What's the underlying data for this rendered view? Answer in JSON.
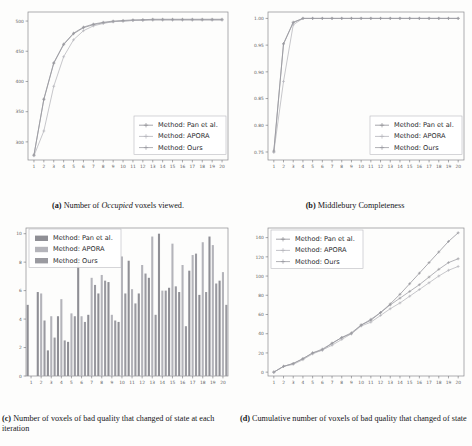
{
  "figure": {
    "panels": [
      {
        "id": "a",
        "caption_label": "(a)",
        "caption_pre": " Number of ",
        "caption_em": "Occupied",
        "caption_post": " voxels viewed."
      },
      {
        "id": "b",
        "caption_label": "(b)",
        "caption_pre": " Middlebury Completeness",
        "caption_em": "",
        "caption_post": ""
      },
      {
        "id": "c",
        "caption_label": "(c)",
        "caption_pre": " Number of voxels of bad quality that changed of state at each iteration",
        "caption_em": "",
        "caption_post": ""
      },
      {
        "id": "d",
        "caption_label": "(d)",
        "caption_pre": " Cumulative number of voxels of bad quality that changed of state",
        "caption_em": "",
        "caption_post": ""
      }
    ]
  },
  "legend_labels": {
    "pan": "Method: Pan et al.",
    "apora": "Method: APORA",
    "ours": "Method: Ours"
  },
  "colors": {
    "series_pan": "#8f8f95",
    "series_apora": "#b4b4ba",
    "series_ours": "#9a9aa0",
    "axis": "#6e6e73",
    "frame": "#8a8a8f",
    "text": "#1c1c1c",
    "tick_text": "#5f5f63",
    "legend_frame": "#b9b9be",
    "page_bg": "#fdfdfc"
  },
  "chart_data": [
    {
      "type": "line",
      "panel": "a",
      "title": "Number of Occupied voxels viewed.",
      "xlabel": "",
      "ylabel": "",
      "grid": false,
      "legend_position": "lower-right",
      "x": [
        1,
        2,
        3,
        4,
        5,
        6,
        7,
        8,
        9,
        10,
        11,
        12,
        13,
        14,
        15,
        16,
        17,
        18,
        19,
        20
      ],
      "xticklabels": [
        "1",
        "2",
        "3",
        "4",
        "5",
        "6",
        "7",
        "8",
        "9",
        "10",
        "11",
        "12",
        "13",
        "14",
        "15",
        "16",
        "17",
        "18",
        "19",
        "20"
      ],
      "yticklabels": [
        "300",
        "350",
        "400",
        "450",
        "500"
      ],
      "ytickvalues": [
        300,
        350,
        400,
        450,
        500
      ],
      "xlim": [
        0.4,
        20.6
      ],
      "ylim": [
        270,
        515
      ],
      "series": [
        {
          "name": "Method: Pan et al.",
          "values": [
            278,
            370,
            430,
            461,
            479,
            489,
            494,
            497,
            499,
            500,
            501,
            502,
            502,
            502,
            502,
            502,
            502,
            502,
            502,
            502
          ]
        },
        {
          "name": "Method: APORA",
          "values": [
            277,
            318,
            392,
            441,
            469,
            484,
            492,
            496,
            499,
            500,
            501,
            501,
            502,
            502,
            502,
            502,
            502,
            502,
            502,
            502
          ]
        },
        {
          "name": "Method: Ours",
          "values": [
            278,
            371,
            431,
            462,
            480,
            490,
            495,
            498,
            500,
            501,
            502,
            502,
            503,
            503,
            503,
            503,
            503,
            503,
            503,
            503
          ]
        }
      ]
    },
    {
      "type": "line",
      "panel": "b",
      "title": "Middlebury Completeness",
      "xlabel": "",
      "ylabel": "",
      "grid": false,
      "legend_position": "lower-right",
      "x": [
        1,
        2,
        3,
        4,
        5,
        6,
        7,
        8,
        9,
        10,
        11,
        12,
        13,
        14,
        15,
        16,
        17,
        18,
        19,
        20
      ],
      "xticklabels": [
        "1",
        "2",
        "3",
        "4",
        "5",
        "6",
        "7",
        "8",
        "9",
        "10",
        "11",
        "12",
        "13",
        "14",
        "15",
        "16",
        "17",
        "18",
        "19",
        "20"
      ],
      "yticklabels": [
        "0.75",
        "0.80",
        "0.85",
        "0.90",
        "0.95",
        "1.00"
      ],
      "ytickvalues": [
        0.75,
        0.8,
        0.85,
        0.9,
        0.95,
        1.0
      ],
      "xlim": [
        0.4,
        20.6
      ],
      "ylim": [
        0.735,
        1.012
      ],
      "series": [
        {
          "name": "Method: Pan et al.",
          "values": [
            0.75,
            0.952,
            0.992,
            1.0,
            1.0,
            1.0,
            1.0,
            1.0,
            1.0,
            1.0,
            1.0,
            1.0,
            1.0,
            1.0,
            1.0,
            1.0,
            1.0,
            1.0,
            1.0,
            1.0
          ]
        },
        {
          "name": "Method: APORA",
          "values": [
            0.75,
            0.882,
            0.988,
            1.0,
            1.0,
            1.0,
            1.0,
            1.0,
            1.0,
            1.0,
            1.0,
            1.0,
            1.0,
            1.0,
            1.0,
            1.0,
            1.0,
            1.0,
            1.0,
            1.0
          ]
        },
        {
          "name": "Method: Ours",
          "values": [
            0.752,
            0.953,
            0.993,
            1.0,
            1.0,
            1.0,
            1.0,
            1.0,
            1.0,
            1.0,
            1.0,
            1.0,
            1.0,
            1.0,
            1.0,
            1.0,
            1.0,
            1.0,
            1.0,
            1.0
          ]
        }
      ]
    },
    {
      "type": "bar",
      "panel": "c",
      "title": "Number of voxels of bad quality that changed of state at each iteration",
      "xlabel": "",
      "ylabel": "",
      "grid": false,
      "legend_position": "upper-left",
      "categories": [
        "1",
        "2",
        "3",
        "4",
        "5",
        "6",
        "7",
        "8",
        "9",
        "10",
        "11",
        "12",
        "13",
        "14",
        "15",
        "16",
        "17",
        "18",
        "19",
        "20"
      ],
      "yticklabels": [
        "0",
        "2",
        "4",
        "6",
        "8",
        "10"
      ],
      "ytickvalues": [
        0,
        2,
        4,
        6,
        8,
        10
      ],
      "ylim": [
        0,
        10.4
      ],
      "series": [
        {
          "name": "Method: Pan et al.",
          "values": [
            5.0,
            5.9,
            1.8,
            4.2,
            2.4,
            8.0,
            4.3,
            5.8,
            6.6,
            3.8,
            8.1,
            5.8,
            6.9,
            10.0,
            6.2,
            5.9,
            7.4,
            5.7,
            9.8,
            6.7
          ]
        },
        {
          "name": "Method: APORA",
          "values": [
            0.0,
            5.8,
            4.2,
            5.4,
            4.4,
            4.2,
            6.9,
            7.1,
            4.3,
            8.4,
            6.1,
            7.8,
            9.8,
            6.0,
            9.3,
            7.8,
            8.5,
            9.4,
            9.2,
            7.3
          ]
        },
        {
          "name": "Method: Ours",
          "values": [
            0.0,
            3.9,
            2.7,
            2.5,
            4.2,
            3.8,
            6.4,
            6.7,
            3.9,
            5.8,
            5.1,
            7.2,
            4.3,
            6.0,
            6.3,
            3.5,
            8.6,
            5.9,
            6.5,
            5.0
          ]
        }
      ]
    },
    {
      "type": "line",
      "panel": "d",
      "title": "Cumulative number of voxels of bad quality that changed of state",
      "xlabel": "",
      "ylabel": "",
      "grid": false,
      "legend_position": "upper-left",
      "x": [
        1,
        2,
        3,
        4,
        5,
        6,
        7,
        8,
        9,
        10,
        11,
        12,
        13,
        14,
        15,
        16,
        17,
        18,
        19,
        20
      ],
      "xticklabels": [
        "1",
        "2",
        "3",
        "4",
        "5",
        "6",
        "7",
        "8",
        "9",
        "10",
        "11",
        "12",
        "13",
        "14",
        "15",
        "16",
        "17",
        "18",
        "19",
        "20"
      ],
      "yticklabels": [
        "0",
        "20",
        "40",
        "60",
        "80",
        "100",
        "120",
        "140"
      ],
      "ytickvalues": [
        0,
        20,
        40,
        60,
        80,
        100,
        120,
        140
      ],
      "xlim": [
        0.4,
        20.6
      ],
      "ylim": [
        -4,
        150
      ],
      "series": [
        {
          "name": "Method: Pan et al.",
          "values": [
            0,
            6,
            9,
            14,
            20,
            23,
            30,
            36,
            40,
            49,
            54,
            62,
            71,
            81,
            92,
            103,
            114,
            125,
            136,
            145
          ]
        },
        {
          "name": "Method: APORA",
          "values": [
            0,
            6,
            8,
            13,
            19,
            23,
            28,
            34,
            40,
            48,
            52,
            59,
            66,
            72,
            79,
            86,
            93,
            100,
            106,
            110
          ]
        },
        {
          "name": "Method: Ours",
          "values": [
            0,
            6,
            9,
            14,
            20,
            24,
            30,
            36,
            41,
            49,
            55,
            62,
            70,
            77,
            84,
            91,
            99,
            107,
            114,
            118
          ]
        }
      ]
    }
  ]
}
